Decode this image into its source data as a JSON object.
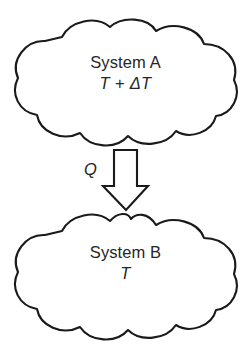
{
  "diagram": {
    "background_color": "#ffffff",
    "stroke_color": "#1a1a1a",
    "text_color": "#262626",
    "nodes": [
      {
        "id": "system-a",
        "shape": "cloud",
        "name_label": "System A",
        "temperature_label": "T + ΔT",
        "position": "top"
      },
      {
        "id": "system-b",
        "shape": "cloud",
        "name_label": "System B",
        "temperature_label": "T",
        "position": "bottom"
      }
    ],
    "connector": {
      "id": "heat-flow-arrow",
      "shape": "block-arrow",
      "direction": "down",
      "label": "Q",
      "from": "system-a",
      "to": "system-b"
    }
  }
}
